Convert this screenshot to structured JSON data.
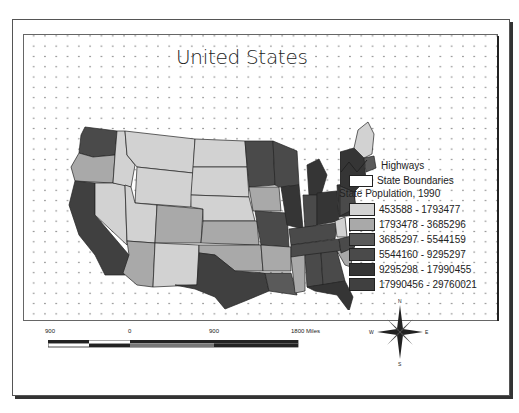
{
  "layout": {
    "title": "United States"
  },
  "legend": {
    "highways_label": "Highways",
    "state_boundaries_label": "State Boundaries",
    "field_title": "State Population, 1990",
    "classes": [
      {
        "label": "453588 - 1793477",
        "color": "#d2d2d2"
      },
      {
        "label": "1793478 - 3685296",
        "color": "#a9a9a9"
      },
      {
        "label": "3685297 - 5544159",
        "color": "#5a5a5a"
      },
      {
        "label": "5544160 - 9295297",
        "color": "#4a4a4a"
      },
      {
        "label": "9295298 - 17990455",
        "color": "#353535"
      },
      {
        "label": "17990456 - 29760021",
        "color": "#404040"
      }
    ]
  },
  "scalebar": {
    "labels": [
      "900",
      "0",
      "900",
      "1800 Miles"
    ]
  },
  "north_arrow": {
    "n": "N",
    "s": "S",
    "e": "E",
    "w": "W"
  }
}
